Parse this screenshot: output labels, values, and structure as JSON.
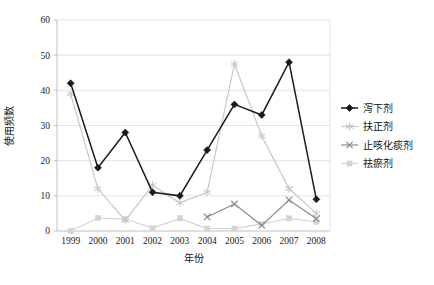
{
  "chart_data": {
    "type": "line",
    "title": "",
    "xlabel": "年份",
    "ylabel": "使用频数",
    "categories": [
      "1999",
      "2000",
      "2001",
      "2002",
      "2003",
      "2004",
      "2005",
      "2006",
      "2007",
      "2008"
    ],
    "ylim": [
      0,
      60
    ],
    "yticks": [
      0,
      10,
      20,
      30,
      40,
      50,
      60
    ],
    "ytick_labels": [
      "0",
      "10",
      "20",
      "30",
      "40",
      "50",
      "60"
    ],
    "grid": "horizontal",
    "legend_position": "right",
    "series": [
      {
        "name": "泻下剂",
        "color": "#1a1a1a",
        "marker": "diamond",
        "values": [
          42,
          18,
          28,
          11,
          10,
          23,
          36,
          33,
          48,
          9
        ]
      },
      {
        "name": "扶正剂",
        "color": "#c8c8c8",
        "marker": "star",
        "values": [
          39,
          12,
          3,
          13,
          8,
          11,
          47.5,
          27,
          12,
          5
        ]
      },
      {
        "name": "止咳化痰剂",
        "color": "#8c8c8c",
        "marker": "x",
        "values": [
          null,
          null,
          null,
          null,
          null,
          4,
          7.7,
          1.6,
          8.8,
          3.5
        ]
      },
      {
        "name": "祛瘀剂",
        "color": "#d4d4d4",
        "marker": "square",
        "values": [
          0,
          3.7,
          3.4,
          0.8,
          3.6,
          0.7,
          0.7,
          2,
          3.6,
          2.6
        ]
      }
    ]
  },
  "legend": {
    "items": [
      {
        "label": "泻下剂"
      },
      {
        "label": "扶正剂"
      },
      {
        "label": "止咳化痰剂"
      },
      {
        "label": "祛瘀剂"
      }
    ]
  },
  "axes": {
    "x_title": "年份",
    "y_title": "使用频数"
  }
}
